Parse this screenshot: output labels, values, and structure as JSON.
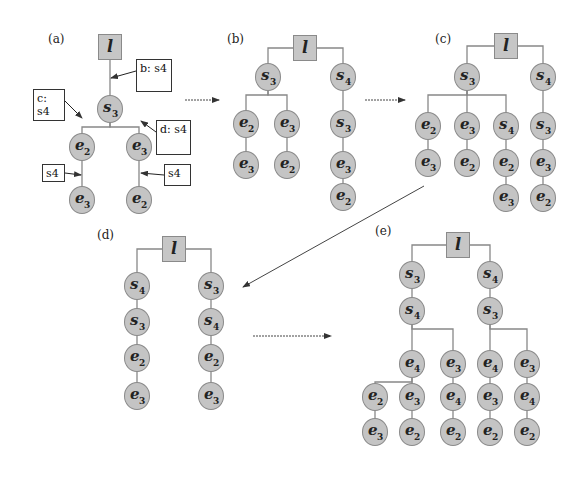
{
  "figure": {
    "colors": {
      "node_fill": "#c4c4c4",
      "node_border": "#8a8a8a",
      "edge": "#888888",
      "arrow": "#444444",
      "note_border": "#333333"
    },
    "root_label": "l",
    "panels": [
      {
        "id": "a",
        "label": "(a)",
        "label_pos": [
          48,
          40
        ],
        "root": [
          110,
          47
        ],
        "nodes": [
          {
            "id": "a1",
            "sym": "s",
            "sub": "3",
            "x": 110,
            "y": 109
          },
          {
            "id": "a2",
            "sym": "e",
            "sub": "2",
            "x": 82,
            "y": 147
          },
          {
            "id": "a3",
            "sym": "e",
            "sub": "3",
            "x": 139,
            "y": 147
          },
          {
            "id": "a4",
            "sym": "e",
            "sub": "3",
            "x": 82,
            "y": 200
          },
          {
            "id": "a5",
            "sym": "e",
            "sub": "2",
            "x": 139,
            "y": 200
          }
        ],
        "edges": [
          [
            "root",
            "a1"
          ],
          [
            "a1",
            "a2"
          ],
          [
            "a1",
            "a3"
          ],
          [
            "a2",
            "a4"
          ],
          [
            "a3",
            "a5"
          ]
        ],
        "notes": [
          {
            "text": "b: s4",
            "x": 136,
            "y": 59,
            "w": 36,
            "h": 33,
            "arrow_to": [
              111,
              78
            ]
          },
          {
            "text": "c: s4",
            "x": 33,
            "y": 89,
            "w": 32,
            "h": 32,
            "arrow_to": [
              82,
              118
            ]
          },
          {
            "text": "d: s4",
            "x": 156,
            "y": 120,
            "w": 35,
            "h": 35,
            "arrow_to": [
              141,
              121
            ]
          },
          {
            "text": "s4",
            "x": 42,
            "y": 164,
            "w": 23,
            "h": 18,
            "arrow_to": [
              81,
              175
            ]
          },
          {
            "text": "s4",
            "x": 164,
            "y": 164,
            "w": 27,
            "h": 22,
            "arrow_to": [
              141,
              173
            ]
          }
        ]
      },
      {
        "id": "b",
        "label": "(b)",
        "label_pos": [
          227,
          40
        ],
        "root": [
          305,
          48
        ],
        "nodes": [
          {
            "id": "b1",
            "sym": "s",
            "sub": "3",
            "x": 268,
            "y": 77
          },
          {
            "id": "b2",
            "sym": "s",
            "sub": "4",
            "x": 343,
            "y": 77
          },
          {
            "id": "b3",
            "sym": "e",
            "sub": "2",
            "x": 246,
            "y": 124
          },
          {
            "id": "b4",
            "sym": "e",
            "sub": "3",
            "x": 287,
            "y": 124
          },
          {
            "id": "b5",
            "sym": "e",
            "sub": "3",
            "x": 246,
            "y": 165
          },
          {
            "id": "b6",
            "sym": "e",
            "sub": "2",
            "x": 287,
            "y": 165
          },
          {
            "id": "b7",
            "sym": "s",
            "sub": "3",
            "x": 343,
            "y": 124
          },
          {
            "id": "b8",
            "sym": "e",
            "sub": "3",
            "x": 343,
            "y": 165
          },
          {
            "id": "b9",
            "sym": "e",
            "sub": "2",
            "x": 343,
            "y": 197
          }
        ],
        "edges": [
          [
            "root",
            "b1"
          ],
          [
            "root",
            "b2"
          ],
          [
            "b1",
            "b3"
          ],
          [
            "b1",
            "b4"
          ],
          [
            "b3",
            "b5"
          ],
          [
            "b4",
            "b6"
          ],
          [
            "b2",
            "b7"
          ],
          [
            "b7",
            "b8"
          ],
          [
            "b8",
            "b9"
          ]
        ]
      },
      {
        "id": "c",
        "label": "(c)",
        "label_pos": [
          435,
          40
        ],
        "root": [
          506,
          46
        ],
        "nodes": [
          {
            "id": "c1",
            "sym": "s",
            "sub": "3",
            "x": 467,
            "y": 77
          },
          {
            "id": "c2",
            "sym": "s",
            "sub": "4",
            "x": 543,
            "y": 77
          },
          {
            "id": "c3",
            "sym": "e",
            "sub": "2",
            "x": 428,
            "y": 126
          },
          {
            "id": "c4",
            "sym": "e",
            "sub": "3",
            "x": 467,
            "y": 126
          },
          {
            "id": "c5",
            "sym": "s",
            "sub": "4",
            "x": 506,
            "y": 126
          },
          {
            "id": "c6",
            "sym": "s",
            "sub": "3",
            "x": 543,
            "y": 126
          },
          {
            "id": "c7",
            "sym": "e",
            "sub": "3",
            "x": 428,
            "y": 163
          },
          {
            "id": "c8",
            "sym": "e",
            "sub": "2",
            "x": 467,
            "y": 163
          },
          {
            "id": "c9",
            "sym": "e",
            "sub": "2",
            "x": 506,
            "y": 163
          },
          {
            "id": "c10",
            "sym": "e",
            "sub": "3",
            "x": 543,
            "y": 163
          },
          {
            "id": "c11",
            "sym": "e",
            "sub": "3",
            "x": 506,
            "y": 198
          },
          {
            "id": "c12",
            "sym": "e",
            "sub": "2",
            "x": 543,
            "y": 198
          }
        ],
        "edges": [
          [
            "root",
            "c1"
          ],
          [
            "root",
            "c2"
          ],
          [
            "c1",
            "c3"
          ],
          [
            "c1",
            "c4"
          ],
          [
            "c1",
            "c5"
          ],
          [
            "c2",
            "c6"
          ],
          [
            "c3",
            "c7"
          ],
          [
            "c4",
            "c8"
          ],
          [
            "c5",
            "c9"
          ],
          [
            "c6",
            "c10"
          ],
          [
            "c9",
            "c11"
          ],
          [
            "c10",
            "c12"
          ]
        ]
      },
      {
        "id": "d",
        "label": "(d)",
        "label_pos": [
          97,
          236
        ],
        "root": [
          174,
          249
        ],
        "nodes": [
          {
            "id": "d1",
            "sym": "s",
            "sub": "4",
            "x": 137,
            "y": 286
          },
          {
            "id": "d2",
            "sym": "s",
            "sub": "3",
            "x": 137,
            "y": 322
          },
          {
            "id": "d3",
            "sym": "e",
            "sub": "2",
            "x": 137,
            "y": 358
          },
          {
            "id": "d4",
            "sym": "e",
            "sub": "3",
            "x": 137,
            "y": 396
          },
          {
            "id": "d5",
            "sym": "s",
            "sub": "3",
            "x": 211,
            "y": 286
          },
          {
            "id": "d6",
            "sym": "s",
            "sub": "4",
            "x": 211,
            "y": 322
          },
          {
            "id": "d7",
            "sym": "e",
            "sub": "2",
            "x": 211,
            "y": 358
          },
          {
            "id": "d8",
            "sym": "e",
            "sub": "3",
            "x": 211,
            "y": 396
          }
        ],
        "edges": [
          [
            "root",
            "d1"
          ],
          [
            "d1",
            "d2"
          ],
          [
            "d2",
            "d3"
          ],
          [
            "d3",
            "d4"
          ],
          [
            "root",
            "d5"
          ],
          [
            "d5",
            "d6"
          ],
          [
            "d6",
            "d7"
          ],
          [
            "d7",
            "d8"
          ]
        ]
      },
      {
        "id": "e",
        "label": "(e)",
        "label_pos": [
          375,
          232
        ],
        "root": [
          458,
          245
        ],
        "nodes": [
          {
            "id": "e1",
            "sym": "s",
            "sub": "3",
            "x": 412,
            "y": 275
          },
          {
            "id": "e2",
            "sym": "s",
            "sub": "4",
            "x": 490,
            "y": 275
          },
          {
            "id": "e3",
            "sym": "s",
            "sub": "4",
            "x": 412,
            "y": 311
          },
          {
            "id": "e4",
            "sym": "s",
            "sub": "3",
            "x": 490,
            "y": 311
          },
          {
            "id": "e5",
            "sym": "e",
            "sub": "4",
            "x": 412,
            "y": 364
          },
          {
            "id": "e6",
            "sym": "e",
            "sub": "3",
            "x": 453,
            "y": 364
          },
          {
            "id": "e7",
            "sym": "e",
            "sub": "4",
            "x": 490,
            "y": 364
          },
          {
            "id": "e8",
            "sym": "e",
            "sub": "3",
            "x": 527,
            "y": 364
          },
          {
            "id": "e9",
            "sym": "e",
            "sub": "2",
            "x": 375,
            "y": 397
          },
          {
            "id": "e10",
            "sym": "e",
            "sub": "3",
            "x": 412,
            "y": 397
          },
          {
            "id": "e11",
            "sym": "e",
            "sub": "4",
            "x": 453,
            "y": 397
          },
          {
            "id": "e12",
            "sym": "e",
            "sub": "3",
            "x": 490,
            "y": 397
          },
          {
            "id": "e13",
            "sym": "e",
            "sub": "4",
            "x": 527,
            "y": 397
          },
          {
            "id": "e14",
            "sym": "e",
            "sub": "3",
            "x": 375,
            "y": 432
          },
          {
            "id": "e15",
            "sym": "e",
            "sub": "2",
            "x": 412,
            "y": 432
          },
          {
            "id": "e16",
            "sym": "e",
            "sub": "2",
            "x": 453,
            "y": 432
          },
          {
            "id": "e17",
            "sym": "e",
            "sub": "2",
            "x": 490,
            "y": 432
          },
          {
            "id": "e18",
            "sym": "e",
            "sub": "2",
            "x": 527,
            "y": 432
          }
        ],
        "edges": [
          [
            "root",
            "e1"
          ],
          [
            "root",
            "e2"
          ],
          [
            "e1",
            "e3"
          ],
          [
            "e2",
            "e4"
          ],
          [
            "e3",
            "e5"
          ],
          [
            "e3",
            "e6"
          ],
          [
            "e4",
            "e7"
          ],
          [
            "e4",
            "e8"
          ],
          [
            "e5",
            "e9"
          ],
          [
            "e5",
            "e10"
          ],
          [
            "e6",
            "e11"
          ],
          [
            "e7",
            "e12"
          ],
          [
            "e8",
            "e13"
          ],
          [
            "e9",
            "e14"
          ],
          [
            "e10",
            "e15"
          ],
          [
            "e11",
            "e16"
          ],
          [
            "e12",
            "e17"
          ],
          [
            "e13",
            "e18"
          ]
        ]
      }
    ],
    "transitions": [
      {
        "from": "a",
        "to": "b",
        "x1": 185,
        "y1": 100,
        "x2": 219,
        "y2": 100,
        "style": "dotted"
      },
      {
        "from": "b",
        "to": "c",
        "x1": 365,
        "y1": 100,
        "x2": 405,
        "y2": 100,
        "style": "dotted"
      },
      {
        "from": "c",
        "to": "d",
        "x1": 424,
        "y1": 186,
        "x2": 243,
        "y2": 287,
        "style": "solid"
      },
      {
        "from": "d",
        "to": "e",
        "x1": 253,
        "y1": 336,
        "x2": 331,
        "y2": 336,
        "style": "dotted"
      }
    ]
  }
}
